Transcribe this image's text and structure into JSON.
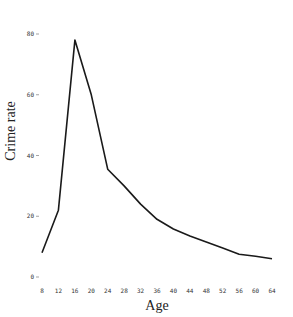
{
  "chart_data": {
    "type": "line",
    "title": "",
    "xlabel": "Age",
    "ylabel": "Crime rate",
    "x": [
      8,
      12,
      16,
      20,
      24,
      28,
      32,
      36,
      40,
      44,
      48,
      52,
      56,
      60,
      64
    ],
    "series": [
      {
        "name": "Crime rate",
        "values": [
          8,
          22,
          78,
          60,
          35.5,
          30,
          24,
          19,
          15.8,
          13.5,
          11.5,
          9.5,
          7.5,
          6.8,
          6
        ]
      }
    ],
    "x_ticks": [
      "8",
      "12",
      "16",
      "20",
      "24",
      "28",
      "32",
      "36",
      "40",
      "44",
      "48",
      "52",
      "56",
      "60",
      "64"
    ],
    "y_ticks": [
      "0",
      "20",
      "40",
      "60",
      "80"
    ],
    "xlim": [
      8,
      64
    ],
    "ylim": [
      0,
      80
    ],
    "grid": false,
    "legend": false,
    "line_color": "#1a1a1a"
  }
}
